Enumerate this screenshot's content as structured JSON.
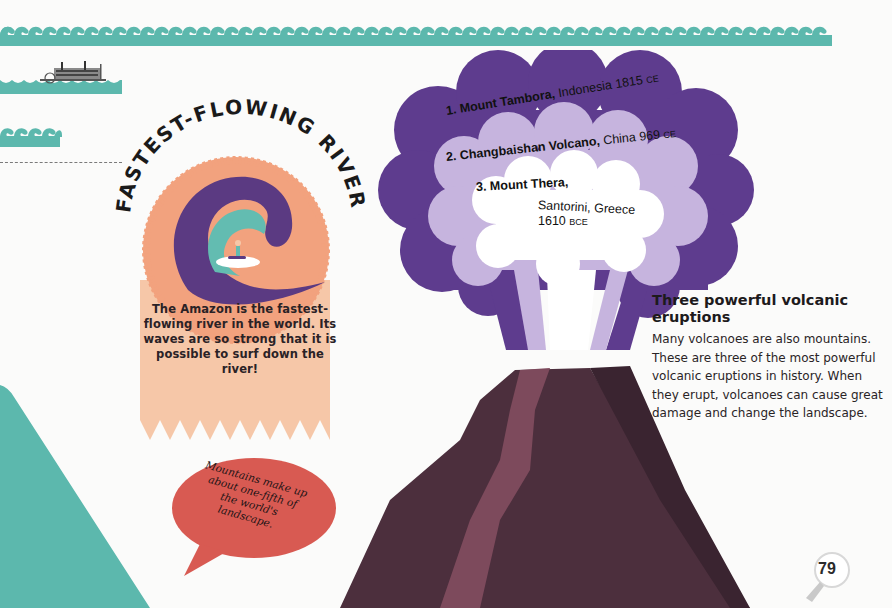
{
  "colors": {
    "wave_teal": "#5cb8ad",
    "cloud_outer": "#5e3c8e",
    "cloud_middle": "#c6b4de",
    "cloud_inner": "#ffffff",
    "volcano_body": "#4c2f3d",
    "volcano_lava": "#7d4a5c",
    "volcano_shadow": "#3a2430",
    "rosette": "#f2a27e",
    "ribbon": "#f6c7a8",
    "wave_dark": "#5b3a82",
    "wave_light": "#63bcb1",
    "speech_bubble": "#d85a52",
    "left_mountain": "#5cb8ad"
  },
  "river_badge": {
    "title": "FASTEST-FLOWING RIVER",
    "description": "The Amazon is the fastest-flowing river in the world. Its waves are so strong that it is possible to surf down the river!"
  },
  "speech_bubble": {
    "text": "Mountains make up about one-fifth of the world's landscape."
  },
  "eruptions": {
    "items": [
      {
        "rank": "1.",
        "name": "Mount Tambora,",
        "place": " Indonesia 1815 ",
        "era": "CE"
      },
      {
        "rank": "2.",
        "name": "Changbaishan Volcano,",
        "place": " China 969 ",
        "era": "CE"
      },
      {
        "rank": "3.",
        "name": "Mount Thera,",
        "place": "Santorini, Greece",
        "year": "1610 ",
        "era": "BCE"
      }
    ],
    "title": "Three powerful volcanic eruptions",
    "body": "Many volcanoes are also mountains. These are three of the most powerful volcanic eruptions in history. When they erupt, volcanoes can cause great damage and change the landscape."
  },
  "page": {
    "number": "79"
  }
}
